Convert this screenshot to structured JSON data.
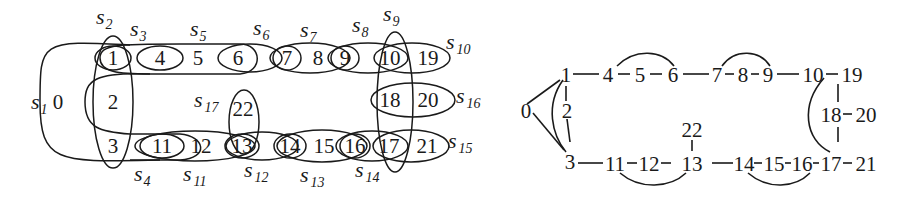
{
  "figure": {
    "left_panel": {
      "description": "Hypergraph with vertices 0-22 and hyperedges s1-s17",
      "vertices": [
        {
          "id": "0",
          "x": 57,
          "y": 102
        },
        {
          "id": "1",
          "x": 113,
          "y": 58
        },
        {
          "id": "2",
          "x": 113,
          "y": 102
        },
        {
          "id": "3",
          "x": 113,
          "y": 146
        },
        {
          "id": "4",
          "x": 160,
          "y": 58
        },
        {
          "id": "5",
          "x": 198,
          "y": 58
        },
        {
          "id": "6",
          "x": 238,
          "y": 58
        },
        {
          "id": "7",
          "x": 287,
          "y": 58
        },
        {
          "id": "8",
          "x": 318,
          "y": 58
        },
        {
          "id": "9",
          "x": 345,
          "y": 58
        },
        {
          "id": "10",
          "x": 390,
          "y": 58
        },
        {
          "id": "19",
          "x": 428,
          "y": 58
        },
        {
          "id": "18",
          "x": 390,
          "y": 100
        },
        {
          "id": "20",
          "x": 428,
          "y": 100
        },
        {
          "id": "11",
          "x": 162,
          "y": 146
        },
        {
          "id": "12",
          "x": 201,
          "y": 146
        },
        {
          "id": "13",
          "x": 242,
          "y": 146
        },
        {
          "id": "22",
          "x": 242,
          "y": 109
        },
        {
          "id": "14",
          "x": 290,
          "y": 146
        },
        {
          "id": "15",
          "x": 324,
          "y": 146
        },
        {
          "id": "16",
          "x": 355,
          "y": 146
        },
        {
          "id": "17",
          "x": 388,
          "y": 146
        },
        {
          "id": "21",
          "x": 427,
          "y": 146
        }
      ],
      "hyperedges": [
        {
          "name": "s",
          "sub": "1",
          "members": [
            "0",
            "1",
            "3"
          ]
        },
        {
          "name": "s",
          "sub": "2",
          "members": [
            "1",
            "2",
            "3"
          ]
        },
        {
          "name": "s",
          "sub": "3",
          "members": [
            "1",
            "4"
          ]
        },
        {
          "name": "s",
          "sub": "4",
          "members": [
            "2",
            "3",
            "11"
          ]
        },
        {
          "name": "s",
          "sub": "5",
          "members": [
            "1",
            "4",
            "5",
            "6"
          ]
        },
        {
          "name": "s",
          "sub": "6",
          "members": [
            "6",
            "7"
          ]
        },
        {
          "name": "s",
          "sub": "7",
          "members": [
            "7",
            "8",
            "9"
          ]
        },
        {
          "name": "s",
          "sub": "8",
          "members": [
            "9",
            "10"
          ]
        },
        {
          "name": "s",
          "sub": "9",
          "members": [
            "10",
            "18",
            "17"
          ]
        },
        {
          "name": "s",
          "sub": "10",
          "members": [
            "10",
            "19"
          ]
        },
        {
          "name": "s",
          "sub": "11",
          "members": [
            "11",
            "12",
            "13"
          ]
        },
        {
          "name": "s",
          "sub": "12",
          "members": [
            "13",
            "14"
          ]
        },
        {
          "name": "s",
          "sub": "13",
          "members": [
            "14",
            "15",
            "16"
          ]
        },
        {
          "name": "s",
          "sub": "14",
          "members": [
            "16",
            "17"
          ]
        },
        {
          "name": "s",
          "sub": "15",
          "members": [
            "17",
            "21"
          ]
        },
        {
          "name": "s",
          "sub": "16",
          "members": [
            "18",
            "20"
          ]
        },
        {
          "name": "s",
          "sub": "17",
          "members": [
            "13",
            "22"
          ]
        }
      ],
      "labels": {
        "s1": {
          "main": "s",
          "sub": "1"
        },
        "s2": {
          "main": "s",
          "sub": "2"
        },
        "s3": {
          "main": "s",
          "sub": "3"
        },
        "s4": {
          "main": "s",
          "sub": "4"
        },
        "s5": {
          "main": "s",
          "sub": "5"
        },
        "s6": {
          "main": "s",
          "sub": "6"
        },
        "s7": {
          "main": "s",
          "sub": "7"
        },
        "s8": {
          "main": "s",
          "sub": "8"
        },
        "s9": {
          "main": "s",
          "sub": "9"
        },
        "s10": {
          "main": "s",
          "sub": "10"
        },
        "s11": {
          "main": "s",
          "sub": "11"
        },
        "s12": {
          "main": "s",
          "sub": "12"
        },
        "s13": {
          "main": "s",
          "sub": "13"
        },
        "s14": {
          "main": "s",
          "sub": "14"
        },
        "s15": {
          "main": "s",
          "sub": "15"
        },
        "s16": {
          "main": "s",
          "sub": "16"
        },
        "s17": {
          "main": "s",
          "sub": "17"
        }
      }
    },
    "right_panel": {
      "description": "Graph with vertices 0-22 and straight/curved edges",
      "vertices": {
        "v0": "0",
        "v1": "1",
        "v2": "2",
        "v3": "3",
        "v4": "4",
        "v5": "5",
        "v6": "6",
        "v7": "7",
        "v8": "8",
        "v9": "9",
        "v10": "10",
        "v19": "19",
        "v18": "18",
        "v20": "20",
        "v22": "22",
        "v11": "11",
        "v12": "12",
        "v13": "13",
        "v14": "14",
        "v15": "15",
        "v16": "16",
        "v17": "17",
        "v21": "21"
      },
      "straight_edges": [
        [
          "0",
          "1"
        ],
        [
          "0",
          "3"
        ],
        [
          "1",
          "2"
        ],
        [
          "2",
          "3"
        ],
        [
          "1",
          "4"
        ],
        [
          "4",
          "5"
        ],
        [
          "5",
          "6"
        ],
        [
          "6",
          "7"
        ],
        [
          "7",
          "8"
        ],
        [
          "8",
          "9"
        ],
        [
          "9",
          "10"
        ],
        [
          "10",
          "19"
        ],
        [
          "10",
          "18"
        ],
        [
          "18",
          "20"
        ],
        [
          "18",
          "17"
        ],
        [
          "3",
          "11"
        ],
        [
          "11",
          "12"
        ],
        [
          "12",
          "13"
        ],
        [
          "13",
          "22"
        ],
        [
          "13",
          "14"
        ],
        [
          "14",
          "15"
        ],
        [
          "15",
          "16"
        ],
        [
          "16",
          "17"
        ],
        [
          "17",
          "21"
        ]
      ],
      "curved_edges": [
        [
          "1",
          "3"
        ],
        [
          "4",
          "6"
        ],
        [
          "7",
          "9"
        ],
        [
          "10",
          "17"
        ],
        [
          "11",
          "13"
        ],
        [
          "14",
          "16"
        ]
      ]
    }
  }
}
